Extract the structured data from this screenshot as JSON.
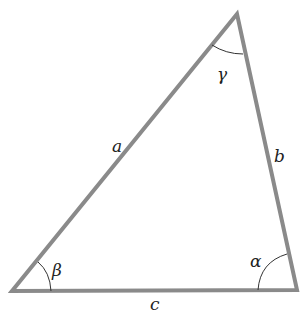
{
  "diagram": {
    "type": "triangle",
    "colors": {
      "edge": "#8a8a8a",
      "arc": "#333333",
      "text": "#222222"
    },
    "vertices": {
      "top": [
        237,
        14
      ],
      "bottom_left": [
        12,
        291
      ],
      "bottom_right": [
        297,
        290
      ]
    },
    "sides": {
      "a": "a",
      "b": "b",
      "c": "c"
    },
    "angles": {
      "alpha": "α",
      "beta": "β",
      "gamma": "γ"
    }
  }
}
